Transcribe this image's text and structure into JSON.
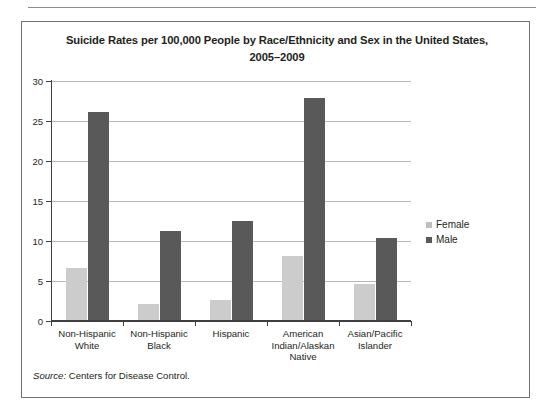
{
  "figure": {
    "title": "Suicide Rates per 100,000 People by Race/Ethnicity and Sex in the United States, 2005–2009",
    "title_line1": "Suicide Rates per 100,000 People by Race/Ethnicity and Sex in the United States,",
    "title_line2": "2005–2009",
    "source_keyword": "Source:",
    "source_text": " Centers for Disease Control."
  },
  "legend": {
    "position": "right",
    "items": [
      {
        "label": "Female",
        "color": "#cccccc"
      },
      {
        "label": "Male",
        "color": "#595959"
      }
    ]
  },
  "axis": {
    "y_ticks": [
      "0",
      "5",
      "10",
      "15",
      "20",
      "25",
      "30"
    ]
  },
  "categories": [
    {
      "line1": "Non-Hispanic",
      "line2": "White",
      "line3": ""
    },
    {
      "line1": "Non-Hispanic",
      "line2": "Black",
      "line3": ""
    },
    {
      "line1": "Hispanic",
      "line2": "",
      "line3": ""
    },
    {
      "line1": "American",
      "line2": "Indian/Alaskan",
      "line3": "Native"
    },
    {
      "line1": "Asian/Pacific",
      "line2": "Islander",
      "line3": ""
    }
  ],
  "chart_data": {
    "type": "bar",
    "title": "Suicide Rates per 100,000 People by Race/Ethnicity and Sex in the United States, 2005–2009",
    "xlabel": "",
    "ylabel": "",
    "ylim": [
      0,
      30
    ],
    "yticks": [
      0,
      5,
      10,
      15,
      20,
      25,
      30
    ],
    "grid": true,
    "legend_position": "right",
    "categories": [
      "Non-Hispanic White",
      "Non-Hispanic Black",
      "Hispanic",
      "American Indian/Alaskan Native",
      "Asian/Pacific Islander"
    ],
    "series": [
      {
        "name": "Female",
        "color": "#cccccc",
        "values": [
          6.5,
          2.0,
          2.5,
          8.0,
          4.5
        ]
      },
      {
        "name": "Male",
        "color": "#595959",
        "values": [
          26.0,
          11.1,
          12.4,
          27.8,
          10.2
        ]
      }
    ],
    "source": "Source: Centers for Disease Control."
  }
}
